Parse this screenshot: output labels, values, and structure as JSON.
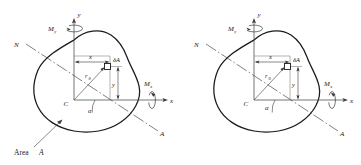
{
  "figure": {
    "type": "engineering-diagram",
    "panels": [
      {
        "id": "left",
        "labels": {
          "y_axis": "y",
          "x_axis": "x",
          "moment_y": "M",
          "moment_y_sub": "y",
          "moment_x": "M",
          "moment_x_sub": "x",
          "neutral_axis_start": "N",
          "neutral_axis_end": "A",
          "centroid": "C",
          "coord_x": "x",
          "coord_y": "y",
          "element": "δA",
          "radius": "r",
          "radius_sub": "0",
          "angle": "α",
          "area_label": "Area",
          "area_label_italic": "A"
        }
      },
      {
        "id": "right",
        "labels": {
          "y_axis": "y",
          "x_axis": "x",
          "moment_y": "M",
          "moment_y_sub": "y",
          "moment_x": "M",
          "moment_x_sub": "x",
          "neutral_axis_start": "N",
          "neutral_axis_end": "A",
          "centroid": "C",
          "coord_x": "x",
          "coord_y": "y",
          "element": "δA",
          "radius": "r",
          "radius_sub": "0",
          "angle": "α"
        }
      }
    ],
    "colors": {
      "outline": "#1a1a1a",
      "thin_line": "#555555",
      "text": "#1a1a1a",
      "background": "#ffffff"
    }
  }
}
